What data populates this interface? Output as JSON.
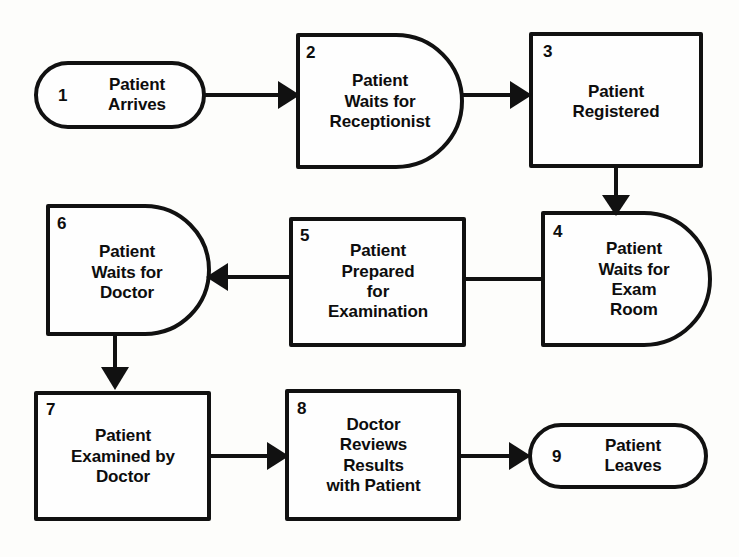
{
  "diagram": {
    "colors": {
      "line": "#111111",
      "fill": "#fefefe",
      "background": "#fdfdfb",
      "text": "#0d0d0d"
    },
    "nodes": [
      {
        "id": "node-1",
        "number": "1",
        "shape": "stadium",
        "lines": [
          "Patient",
          "Arrives"
        ],
        "text": "Patient Arrives"
      },
      {
        "id": "node-2",
        "number": "2",
        "shape": "delay",
        "lines": [
          "Patient",
          "Waits for",
          "Receptionist"
        ],
        "text": "Patient Waits for Receptionist"
      },
      {
        "id": "node-3",
        "number": "3",
        "shape": "rectangle",
        "lines": [
          "Patient",
          "Registered"
        ],
        "text": "Patient Registered"
      },
      {
        "id": "node-4",
        "number": "4",
        "shape": "delay",
        "lines": [
          "Patient",
          "Waits for",
          "Exam",
          "Room"
        ],
        "text": "Patient Waits for Exam Room"
      },
      {
        "id": "node-5",
        "number": "5",
        "shape": "rectangle",
        "lines": [
          "Patient",
          "Prepared",
          "for",
          "Examination"
        ],
        "text": "Patient Prepared for Examination"
      },
      {
        "id": "node-6",
        "number": "6",
        "shape": "delay",
        "lines": [
          "Patient",
          "Waits for",
          "Doctor"
        ],
        "text": "Patient Waits for Doctor"
      },
      {
        "id": "node-7",
        "number": "7",
        "shape": "rectangle",
        "lines": [
          "Patient",
          "Examined by",
          "Doctor"
        ],
        "text": "Patient Examined by Doctor"
      },
      {
        "id": "node-8",
        "number": "8",
        "shape": "rectangle",
        "lines": [
          "Doctor",
          "Reviews",
          "Results",
          "with Patient"
        ],
        "text": "Doctor Reviews Results with Patient"
      },
      {
        "id": "node-9",
        "number": "9",
        "shape": "stadium",
        "lines": [
          "Patient",
          "Leaves"
        ],
        "text": "Patient Leaves"
      }
    ],
    "edges": [
      {
        "id": "edge-1-2",
        "from": "1",
        "to": "2",
        "direction": "right"
      },
      {
        "id": "edge-2-3",
        "from": "2",
        "to": "3",
        "direction": "right"
      },
      {
        "id": "edge-3-4",
        "from": "3",
        "to": "4",
        "direction": "down"
      },
      {
        "id": "edge-4-5",
        "from": "4",
        "to": "5",
        "direction": "left"
      },
      {
        "id": "edge-5-6",
        "from": "5",
        "to": "6",
        "direction": "left"
      },
      {
        "id": "edge-6-7",
        "from": "6",
        "to": "7",
        "direction": "down"
      },
      {
        "id": "edge-7-8",
        "from": "7",
        "to": "8",
        "direction": "right"
      },
      {
        "id": "edge-8-9",
        "from": "8",
        "to": "9",
        "direction": "right"
      }
    ]
  }
}
